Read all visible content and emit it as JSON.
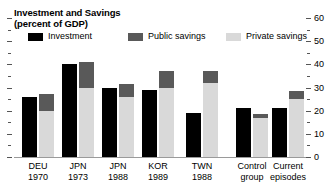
{
  "chart_data": {
    "type": "bar",
    "title": "Investment and Savings",
    "subtitle": "(percent of GDP)",
    "xlabel": "",
    "ylabel": "",
    "ylim": [
      0,
      60
    ],
    "y_ticks": [
      0,
      10,
      20,
      30,
      40,
      50,
      60
    ],
    "y_minor_ticks": [
      5,
      15,
      25,
      35,
      45,
      55
    ],
    "grid": false,
    "legend_position": "top",
    "stacked_savings": true,
    "axis_side": "right",
    "categories": [
      "DEU 1970",
      "JPN 1973",
      "JPN 1988",
      "KOR 1989",
      "TWN 1988",
      "Control group",
      "Current episodes"
    ],
    "series": [
      {
        "name": "Investment",
        "color": "#000000",
        "values": [
          26,
          40,
          30,
          29,
          19,
          21,
          21
        ]
      },
      {
        "name": "Public savings",
        "color": "#595959",
        "values": [
          7,
          11,
          5.5,
          7,
          5,
          1.5,
          3.5
        ]
      },
      {
        "name": "Private savings",
        "color": "#d9d9d9",
        "values": [
          20,
          30,
          26,
          30,
          32,
          17,
          25
        ]
      }
    ],
    "savings_totals": [
      27,
      41,
      31.5,
      37,
      37,
      18.5,
      28.5
    ]
  },
  "header": {
    "title_line1": "Investment and Savings",
    "title_line2": "(percent of GDP)"
  },
  "legend": {
    "items": [
      {
        "label": "Investment",
        "color": "#000000"
      },
      {
        "label": "Public savings",
        "color": "#595959"
      },
      {
        "label": "Private savings",
        "color": "#d9d9d9"
      }
    ]
  },
  "axis": {
    "tick_labels": [
      "60",
      "50",
      "40",
      "30",
      "20",
      "10",
      "0"
    ]
  },
  "categories": [
    {
      "line1": "DEU",
      "line2": "1970"
    },
    {
      "line1": "JPN",
      "line2": "1973"
    },
    {
      "line1": "JPN",
      "line2": "1988"
    },
    {
      "line1": "KOR",
      "line2": "1989"
    },
    {
      "line1": "TWN",
      "line2": "1988"
    },
    {
      "line1": "Control",
      "line2": "group"
    },
    {
      "line1": "Current",
      "line2": "episodes"
    }
  ]
}
